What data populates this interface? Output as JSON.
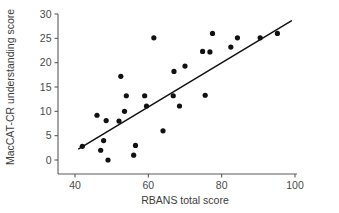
{
  "chart_data": {
    "type": "scatter",
    "title": "",
    "xlabel": "RBANS total score",
    "ylabel": "MacCAT-CR understanding score",
    "xlim": [
      38,
      101
    ],
    "ylim": [
      -1.5,
      30.5
    ],
    "xticks": [
      40,
      60,
      80,
      100
    ],
    "xtick_labels": [
      "40",
      "60",
      "80",
      "100"
    ],
    "yticks": [
      0,
      5,
      10,
      15,
      20,
      25,
      30
    ],
    "ytick_labels": [
      "0",
      "5",
      "10",
      "15",
      "20",
      "25",
      "30"
    ],
    "grid": false,
    "legend": "none",
    "marker": "filled-circle",
    "marker_color": "#111111",
    "points": [
      {
        "x": 42.0,
        "y": 2.8
      },
      {
        "x": 46.0,
        "y": 9.2
      },
      {
        "x": 47.0,
        "y": 2.0
      },
      {
        "x": 47.8,
        "y": 4.0
      },
      {
        "x": 48.5,
        "y": 8.1
      },
      {
        "x": 49.0,
        "y": 0.0
      },
      {
        "x": 52.0,
        "y": 8.0
      },
      {
        "x": 52.5,
        "y": 17.2
      },
      {
        "x": 53.5,
        "y": 10.0
      },
      {
        "x": 54.0,
        "y": 13.2
      },
      {
        "x": 56.0,
        "y": 1.0
      },
      {
        "x": 56.5,
        "y": 3.0
      },
      {
        "x": 59.0,
        "y": 13.2
      },
      {
        "x": 59.5,
        "y": 11.1
      },
      {
        "x": 61.5,
        "y": 25.1
      },
      {
        "x": 64.0,
        "y": 6.0
      },
      {
        "x": 66.8,
        "y": 13.2
      },
      {
        "x": 67.0,
        "y": 18.2
      },
      {
        "x": 68.5,
        "y": 11.1
      },
      {
        "x": 70.0,
        "y": 19.3
      },
      {
        "x": 74.8,
        "y": 22.3
      },
      {
        "x": 75.5,
        "y": 13.3
      },
      {
        "x": 76.8,
        "y": 22.2
      },
      {
        "x": 77.5,
        "y": 26.0
      },
      {
        "x": 82.5,
        "y": 23.2
      },
      {
        "x": 84.3,
        "y": 25.1
      },
      {
        "x": 90.5,
        "y": 25.1
      },
      {
        "x": 95.2,
        "y": 26.0
      }
    ],
    "fit_line": {
      "style": "solid",
      "color": "#111111",
      "x_start": 41.0,
      "y_start": 2.3,
      "x_end": 99.0,
      "y_end": 28.6
    }
  }
}
